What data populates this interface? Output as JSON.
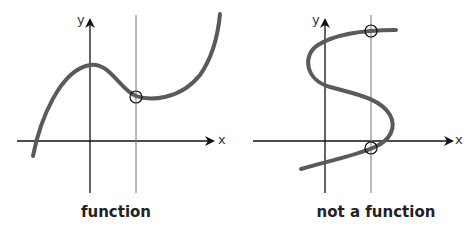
{
  "panels": [
    {
      "caption": "function",
      "x_label": "x",
      "y_label": "y",
      "intersections": 1
    },
    {
      "caption": "not a function",
      "x_label": "x",
      "y_label": "y",
      "intersections": 2
    }
  ],
  "colors": {
    "curve": "#5a5a5a",
    "axis": "#111111",
    "test_line": "#777777"
  }
}
